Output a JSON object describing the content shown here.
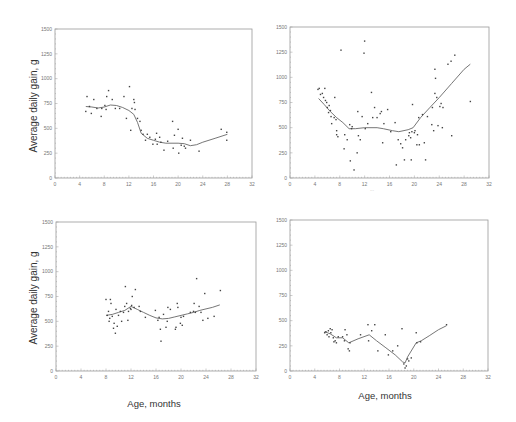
{
  "figure": {
    "y_axis_label": "Average daily gain, g",
    "x_axis_label": "Age, months"
  },
  "chart_data": [
    {
      "type": "scatter",
      "panel": "top-left",
      "title": "",
      "xlabel": "",
      "ylabel": "Average daily gain, g",
      "xlim": [
        0,
        32
      ],
      "ylim": [
        0,
        1500
      ],
      "xticks": [
        0,
        4,
        8,
        12,
        16,
        20,
        24,
        28,
        32
      ],
      "yticks": [
        0,
        250,
        500,
        750,
        1000,
        1250,
        1500
      ],
      "grid": false,
      "frame": {
        "x0": 55,
        "x1": 252,
        "y0": 178,
        "y1": 29
      },
      "points": [
        [
          5,
          670
        ],
        [
          5.2,
          820
        ],
        [
          5.6,
          720
        ],
        [
          5.9,
          650
        ],
        [
          6.3,
          790
        ],
        [
          6.8,
          700
        ],
        [
          7.5,
          620
        ],
        [
          7.6,
          700
        ],
        [
          8.1,
          730
        ],
        [
          8.3,
          690
        ],
        [
          8.4,
          820
        ],
        [
          8.7,
          880
        ],
        [
          9.3,
          790
        ],
        [
          9.8,
          700
        ],
        [
          10.5,
          700
        ],
        [
          11.2,
          820
        ],
        [
          11.6,
          600
        ],
        [
          12.1,
          920
        ],
        [
          12.3,
          480
        ],
        [
          12.5,
          700
        ],
        [
          12.8,
          790
        ],
        [
          12.9,
          760
        ],
        [
          13,
          690
        ],
        [
          13.4,
          600
        ],
        [
          13.8,
          570
        ],
        [
          14,
          480
        ],
        [
          14.3,
          440
        ],
        [
          14.7,
          380
        ],
        [
          15,
          440
        ],
        [
          15.4,
          410
        ],
        [
          15.9,
          340
        ],
        [
          16.3,
          390
        ],
        [
          16.5,
          450
        ],
        [
          16.6,
          340
        ],
        [
          17,
          410
        ],
        [
          17.2,
          360
        ],
        [
          17.7,
          280
        ],
        [
          18.3,
          370
        ],
        [
          19.1,
          570
        ],
        [
          19.2,
          300
        ],
        [
          19.4,
          430
        ],
        [
          20,
          490
        ],
        [
          20.1,
          250
        ],
        [
          20.5,
          330
        ],
        [
          20.7,
          400
        ],
        [
          21,
          320
        ],
        [
          21.2,
          300
        ],
        [
          22,
          380
        ],
        [
          23.4,
          270
        ],
        [
          27,
          490
        ],
        [
          27.9,
          460
        ],
        [
          27.9,
          380
        ]
      ],
      "fit_line": [
        [
          5,
          720
        ],
        [
          6,
          715
        ],
        [
          7,
          705
        ],
        [
          8,
          715
        ],
        [
          9,
          735
        ],
        [
          10,
          730
        ],
        [
          11,
          710
        ],
        [
          12,
          680
        ],
        [
          12.8,
          640
        ],
        [
          13.4,
          560
        ],
        [
          14,
          450
        ],
        [
          15,
          400
        ],
        [
          16,
          380
        ],
        [
          17,
          360
        ],
        [
          18,
          350
        ],
        [
          19,
          350
        ],
        [
          20,
          350
        ],
        [
          21,
          345
        ],
        [
          22,
          325
        ],
        [
          23,
          335
        ],
        [
          24,
          360
        ],
        [
          26,
          400
        ],
        [
          28,
          440
        ]
      ]
    },
    {
      "type": "scatter",
      "panel": "top-right",
      "title": "",
      "xlabel": "...",
      "ylabel": "",
      "xlim": [
        0,
        32
      ],
      "ylim": [
        0,
        1500
      ],
      "xticks": [
        0,
        4,
        8,
        12,
        16,
        20,
        24,
        28,
        32
      ],
      "yticks": [
        0,
        250,
        500,
        750,
        1000,
        1250,
        1500
      ],
      "grid": false,
      "frame": {
        "x0": 290,
        "x1": 489,
        "y0": 178,
        "y1": 27
      },
      "points": [
        [
          4.5,
          880
        ],
        [
          4.7,
          890
        ],
        [
          4.9,
          830
        ],
        [
          5.2,
          840
        ],
        [
          5.4,
          800
        ],
        [
          5.6,
          890
        ],
        [
          5.7,
          770
        ],
        [
          5.9,
          750
        ],
        [
          6,
          700
        ],
        [
          6.2,
          650
        ],
        [
          6.3,
          720
        ],
        [
          6.5,
          670
        ],
        [
          6.6,
          610
        ],
        [
          6.7,
          540
        ],
        [
          7.1,
          600
        ],
        [
          7.2,
          800
        ],
        [
          7.4,
          580
        ],
        [
          7.5,
          470
        ],
        [
          7.5,
          430
        ],
        [
          7.7,
          410
        ],
        [
          8.2,
          1270
        ],
        [
          8.7,
          290
        ],
        [
          8.8,
          430
        ],
        [
          9.2,
          380
        ],
        [
          9.6,
          530
        ],
        [
          9.7,
          170
        ],
        [
          9.9,
          490
        ],
        [
          10,
          510
        ],
        [
          10.3,
          80
        ],
        [
          10.8,
          250
        ],
        [
          10.9,
          660
        ],
        [
          11,
          420
        ],
        [
          11.3,
          380
        ],
        [
          11.6,
          610
        ],
        [
          11.9,
          1240
        ],
        [
          12,
          1360
        ],
        [
          12.1,
          490
        ],
        [
          12.5,
          540
        ],
        [
          13.1,
          850
        ],
        [
          13.3,
          600
        ],
        [
          13.6,
          700
        ],
        [
          14,
          600
        ],
        [
          14.5,
          640
        ],
        [
          14.7,
          660
        ],
        [
          14.9,
          350
        ],
        [
          15.1,
          540
        ],
        [
          15.7,
          680
        ],
        [
          16.2,
          460
        ],
        [
          16.9,
          550
        ],
        [
          17.1,
          130
        ],
        [
          17.4,
          380
        ],
        [
          17.8,
          340
        ],
        [
          18.1,
          300
        ],
        [
          18.4,
          180
        ],
        [
          18.6,
          380
        ],
        [
          19.1,
          420
        ],
        [
          19.2,
          450
        ],
        [
          19.4,
          400
        ],
        [
          19.5,
          180
        ],
        [
          19.6,
          460
        ],
        [
          19.7,
          730
        ],
        [
          20,
          450
        ],
        [
          20.1,
          470
        ],
        [
          20.4,
          330
        ],
        [
          20.5,
          430
        ],
        [
          20.7,
          600
        ],
        [
          20.8,
          330
        ],
        [
          21.3,
          630
        ],
        [
          21.6,
          350
        ],
        [
          21.8,
          180
        ],
        [
          22.1,
          610
        ],
        [
          22.8,
          530
        ],
        [
          22.9,
          700
        ],
        [
          23.1,
          470
        ],
        [
          23.3,
          840
        ],
        [
          23.3,
          1080
        ],
        [
          23.4,
          990
        ],
        [
          23.6,
          800
        ],
        [
          23.8,
          520
        ],
        [
          24.1,
          710
        ],
        [
          24.3,
          740
        ],
        [
          24.5,
          500
        ],
        [
          24.6,
          700
        ],
        [
          25.4,
          1130
        ],
        [
          25.9,
          1160
        ],
        [
          26,
          420
        ],
        [
          26.5,
          1220
        ],
        [
          29,
          760
        ]
      ],
      "fit_line": [
        [
          4.6,
          790
        ],
        [
          5.5,
          730
        ],
        [
          6.5,
          660
        ],
        [
          7.5,
          600
        ],
        [
          8.5,
          550
        ],
        [
          9.5,
          490
        ],
        [
          10.5,
          490
        ],
        [
          12,
          500
        ],
        [
          14,
          500
        ],
        [
          15,
          490
        ],
        [
          16.5,
          470
        ],
        [
          17.5,
          460
        ],
        [
          19,
          480
        ],
        [
          19.8,
          500
        ],
        [
          21,
          600
        ],
        [
          22.5,
          700
        ],
        [
          24,
          800
        ],
        [
          26,
          940
        ],
        [
          28,
          1080
        ],
        [
          29,
          1130
        ]
      ]
    },
    {
      "type": "scatter",
      "panel": "bottom-left",
      "title": "",
      "xlabel": "Age, months",
      "ylabel": "Average daily gain, g",
      "xlim": [
        0,
        32
      ],
      "ylim": [
        0,
        1500
      ],
      "xticks": [
        0,
        4,
        8,
        12,
        16,
        20,
        24,
        28,
        32
      ],
      "yticks": [
        0,
        250,
        500,
        750,
        1000,
        1250,
        1500
      ],
      "grid": false,
      "frame": {
        "x0": 56,
        "x1": 256,
        "y0": 371,
        "y1": 222
      },
      "points": [
        [
          8,
          720
        ],
        [
          8.2,
          560
        ],
        [
          8.4,
          600
        ],
        [
          8.5,
          500
        ],
        [
          8.6,
          530
        ],
        [
          8.7,
          720
        ],
        [
          8.8,
          680
        ],
        [
          9,
          550
        ],
        [
          9.2,
          430
        ],
        [
          9.3,
          480
        ],
        [
          9.5,
          380
        ],
        [
          9.6,
          620
        ],
        [
          9.8,
          450
        ],
        [
          10,
          560
        ],
        [
          10.3,
          600
        ],
        [
          10.5,
          500
        ],
        [
          10.8,
          590
        ],
        [
          11,
          650
        ],
        [
          11.1,
          850
        ],
        [
          11.3,
          680
        ],
        [
          11.5,
          510
        ],
        [
          11.6,
          600
        ],
        [
          11.9,
          630
        ],
        [
          12,
          620
        ],
        [
          12.1,
          660
        ],
        [
          12.2,
          750
        ],
        [
          12.5,
          640
        ],
        [
          12.7,
          820
        ],
        [
          13.3,
          650
        ],
        [
          13.5,
          600
        ],
        [
          14.3,
          540
        ],
        [
          15.9,
          610
        ],
        [
          16.3,
          510
        ],
        [
          16.5,
          540
        ],
        [
          16.7,
          420
        ],
        [
          16.8,
          300
        ],
        [
          17.2,
          570
        ],
        [
          17.6,
          440
        ],
        [
          17.8,
          500
        ],
        [
          17.9,
          640
        ],
        [
          18.3,
          620
        ],
        [
          19.1,
          420
        ],
        [
          19.2,
          440
        ],
        [
          19.4,
          680
        ],
        [
          19.5,
          640
        ],
        [
          19.9,
          480
        ],
        [
          20,
          540
        ],
        [
          20.2,
          460
        ],
        [
          20.4,
          550
        ],
        [
          21.5,
          590
        ],
        [
          22,
          600
        ],
        [
          22.1,
          680
        ],
        [
          22.3,
          590
        ],
        [
          22.5,
          930
        ],
        [
          22.9,
          650
        ],
        [
          23.2,
          590
        ],
        [
          23.5,
          510
        ],
        [
          23.8,
          780
        ],
        [
          24.3,
          530
        ],
        [
          25.3,
          550
        ],
        [
          26.3,
          810
        ]
      ],
      "fit_line": [
        [
          8,
          560
        ],
        [
          9,
          570
        ],
        [
          10,
          590
        ],
        [
          11,
          610
        ],
        [
          12,
          650
        ],
        [
          13,
          620
        ],
        [
          14,
          590
        ],
        [
          15,
          560
        ],
        [
          16,
          535
        ],
        [
          17,
          525
        ],
        [
          18,
          530
        ],
        [
          19,
          545
        ],
        [
          20,
          560
        ],
        [
          21,
          575
        ],
        [
          22,
          590
        ],
        [
          23,
          610
        ],
        [
          24,
          625
        ],
        [
          25,
          640
        ],
        [
          26.2,
          665
        ]
      ]
    },
    {
      "type": "scatter",
      "panel": "bottom-right",
      "title": "",
      "xlabel": "Age, months",
      "ylabel": "",
      "xlim": [
        0,
        32
      ],
      "ylim": [
        0,
        1500
      ],
      "xticks": [
        0,
        4,
        8,
        12,
        16,
        20,
        24,
        28,
        32
      ],
      "yticks": [
        0,
        250,
        500,
        750,
        1000,
        1250,
        1500
      ],
      "grid": false,
      "frame": {
        "x0": 290,
        "x1": 488,
        "y0": 371,
        "y1": 220
      },
      "points": [
        [
          5.6,
          380
        ],
        [
          5.8,
          390
        ],
        [
          6,
          360
        ],
        [
          6.2,
          400
        ],
        [
          6.3,
          340
        ],
        [
          6.5,
          420
        ],
        [
          6.6,
          380
        ],
        [
          6.8,
          410
        ],
        [
          7,
          330
        ],
        [
          7.1,
          290
        ],
        [
          7.3,
          300
        ],
        [
          7.5,
          280
        ],
        [
          7.8,
          340
        ],
        [
          8.5,
          340
        ],
        [
          8.8,
          300
        ],
        [
          8.9,
          410
        ],
        [
          9.2,
          360
        ],
        [
          9.4,
          220
        ],
        [
          9.6,
          200
        ],
        [
          9.7,
          280
        ],
        [
          11.4,
          360
        ],
        [
          12.6,
          460
        ],
        [
          12.7,
          300
        ],
        [
          13.2,
          400
        ],
        [
          13.7,
          460
        ],
        [
          14.2,
          200
        ],
        [
          15.4,
          360
        ],
        [
          15.9,
          160
        ],
        [
          16.6,
          200
        ],
        [
          17.4,
          250
        ],
        [
          18.1,
          420
        ],
        [
          18.4,
          70
        ],
        [
          18.6,
          30
        ],
        [
          18.8,
          50
        ],
        [
          19,
          120
        ],
        [
          19.2,
          100
        ],
        [
          19.6,
          130
        ],
        [
          20.4,
          380
        ],
        [
          20.5,
          280
        ],
        [
          21.1,
          290
        ],
        [
          25.3,
          460
        ]
      ],
      "fit_line": [
        [
          5.6,
          390
        ],
        [
          6.5,
          370
        ],
        [
          7.5,
          330
        ],
        [
          8.5,
          330
        ],
        [
          9.5,
          280
        ],
        [
          11,
          320
        ],
        [
          12.8,
          360
        ],
        [
          14,
          300
        ],
        [
          15.5,
          230
        ],
        [
          17,
          160
        ],
        [
          18.2,
          90
        ],
        [
          18.6,
          80
        ],
        [
          19,
          140
        ],
        [
          20.4,
          280
        ],
        [
          21.2,
          300
        ],
        [
          22.5,
          350
        ],
        [
          24,
          410
        ],
        [
          25.3,
          450
        ]
      ]
    }
  ]
}
